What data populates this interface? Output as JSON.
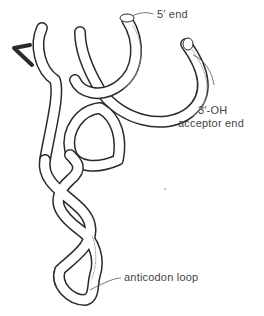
{
  "figure": {
    "labels": {
      "five_prime": "5′ end",
      "three_prime_line1": "3′-OH",
      "three_prime_line2": "acceptor end",
      "anticodon": "anticodon loop"
    },
    "colors": {
      "outline": "#2a2a2a",
      "fill": "#ffffff",
      "shading": "#9a9a9a",
      "text": "#444444"
    }
  }
}
